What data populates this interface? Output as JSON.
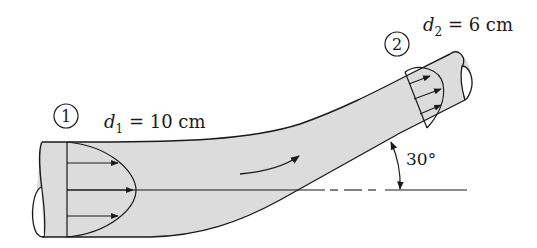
{
  "diagram": {
    "section1": {
      "number": "1",
      "label_var": "d",
      "label_sub": "1",
      "label_value": " = 10 cm"
    },
    "section2": {
      "number": "2",
      "label_var": "d",
      "label_sub": "2",
      "label_value": " = 6 cm"
    },
    "angle_label": "30°",
    "colors": {
      "pipe_fill": "#dcdcdc",
      "stroke": "#1a1a1a",
      "background": "#ffffff"
    }
  }
}
